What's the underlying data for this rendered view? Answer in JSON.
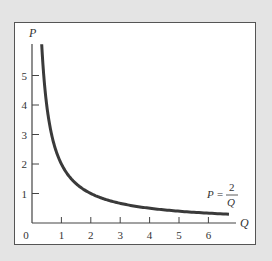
{
  "chart_data": {
    "type": "line",
    "title": "",
    "xlabel": "Q",
    "ylabel": "P",
    "x_ticks": [
      "0",
      "1",
      "2",
      "3",
      "4",
      "5",
      "6"
    ],
    "y_ticks": [
      "1",
      "2",
      "3",
      "4",
      "5"
    ],
    "xlim": [
      0,
      6.8
    ],
    "ylim": [
      0,
      6.2
    ],
    "grid": false,
    "legend": null,
    "series": [
      {
        "name": "P = 2/Q",
        "function": "P = 2/Q",
        "x": [
          0.33,
          0.4,
          0.5,
          0.67,
          1,
          1.5,
          2,
          3,
          4,
          5,
          6,
          6.7
        ],
        "y": [
          6.0,
          5.0,
          4.0,
          3.0,
          2.0,
          1.33,
          1.0,
          0.67,
          0.5,
          0.4,
          0.33,
          0.3
        ]
      }
    ],
    "annotations": [
      {
        "text_lhs": "P =",
        "numerator": "2",
        "denominator": "Q",
        "position": "near curve end, right"
      }
    ]
  },
  "colors": {
    "background": "#e4e4e4",
    "panel": "#ffffff",
    "curve": "#3a3a3a",
    "axis": "#444444"
  }
}
